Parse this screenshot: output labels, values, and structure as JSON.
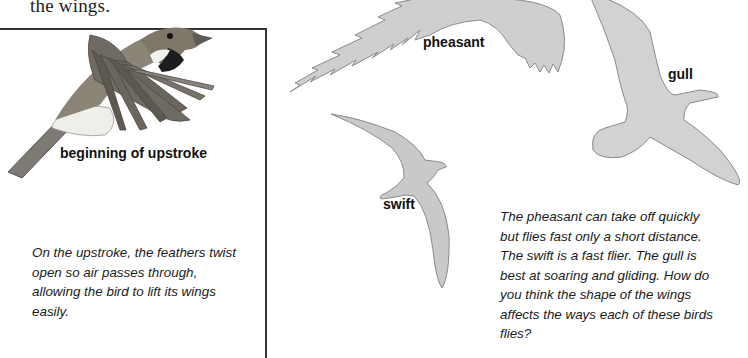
{
  "page": {
    "header_fragment": "the wings."
  },
  "upstroke_panel": {
    "image_label": "beginning of upstroke",
    "caption": "On the upstroke, the feathers twist open so air passes through, allowing the bird to lift its wings easily.",
    "caption_lines": [
      "On the upstroke, the feathers twist",
      "open so air passes through,",
      "allowing the bird to lift its wings",
      "easily."
    ]
  },
  "wing_shapes": {
    "birds": [
      {
        "name": "pheasant",
        "label": "pheasant"
      },
      {
        "name": "gull",
        "label": "gull"
      },
      {
        "name": "swift",
        "label": "swift"
      }
    ],
    "silhouette_color": "#cfcfcf",
    "outline_color": "#8a8a8a",
    "caption_lines": [
      "The pheasant can take off quickly",
      "but flies fast only a short distance.",
      "The swift is a fast flier. The gull is",
      "best at soaring and gliding. How do",
      "you think the shape of the wings",
      "affects the ways each of these birds",
      "flies?"
    ]
  }
}
